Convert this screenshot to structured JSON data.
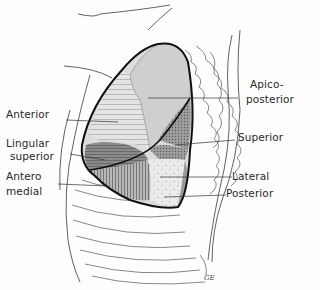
{
  "figure": {
    "labels": {
      "anterior": "Anterior",
      "lingular_superior_1": "Lingular",
      "lingular_superior_2": "superior",
      "anteromedial_1": "Antero",
      "anteromedial_2": "medial",
      "apicoposterior_1": "Apico-",
      "apicoposterior_2": "posterior",
      "superior": "Superior",
      "lateral": "Lateral",
      "posterior": "Posterior"
    },
    "signature": "GE",
    "colors": {
      "ink": "#1a1a1a",
      "segment_light": "#d9d9d9",
      "segment_mid": "#bdbdbd",
      "segment_dark": "#8f8f8f",
      "background": "#fdfdfd"
    }
  }
}
